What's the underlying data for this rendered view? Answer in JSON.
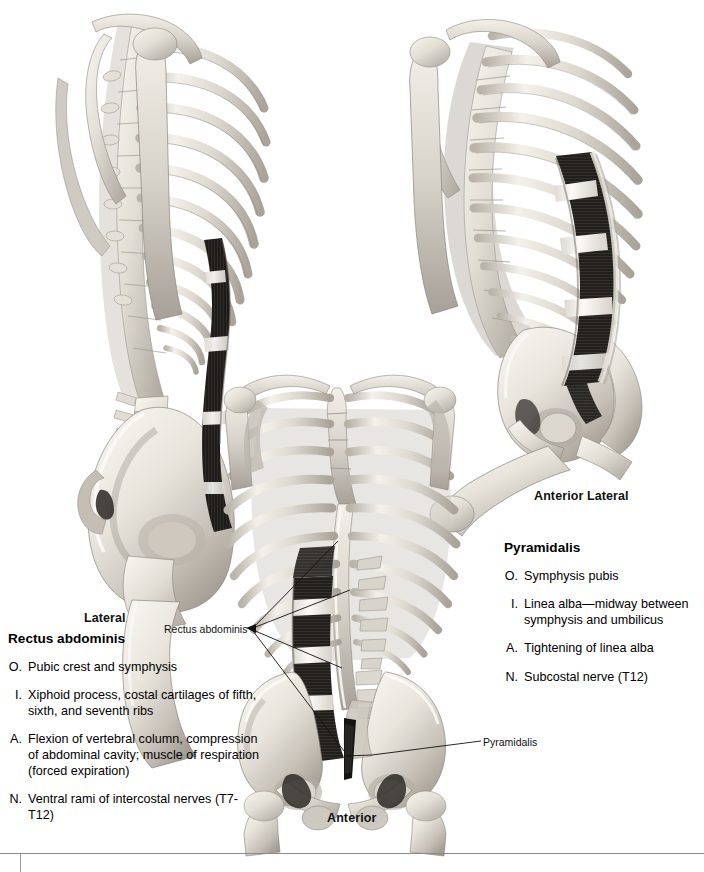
{
  "plate": {
    "subject": "Rectus abdominis and Pyramidalis muscles",
    "views": [
      {
        "id": "lateral",
        "caption": "Lateral"
      },
      {
        "id": "anterior",
        "caption": "Anterior"
      },
      {
        "id": "anterior-lateral",
        "caption": "Anterior Lateral"
      }
    ]
  },
  "captions": {
    "lateral": "Lateral",
    "anterior_lateral": "Anterior Lateral",
    "anterior": "Anterior"
  },
  "leader_labels": {
    "rectus_abdominis": "Rectus abdominis",
    "pyramidalis": "Pyramidalis"
  },
  "muscles": [
    {
      "name": "Rectus abdominis",
      "attributes": [
        {
          "key": "O.",
          "label": "Origin",
          "value": "Pubic crest and symphysis"
        },
        {
          "key": "I.",
          "label": "Insertion",
          "value": "Xiphoid process, costal cartilages of fifth, sixth, and seventh ribs"
        },
        {
          "key": "A.",
          "label": "Action",
          "value": "Flexion of vertebral column, compression of abdominal cavity; muscle of respiration (forced expiration)"
        },
        {
          "key": "N.",
          "label": "Nerve",
          "value": "Ventral rami of intercostal nerves (T7-T12)"
        }
      ]
    },
    {
      "name": "Pyramidalis",
      "attributes": [
        {
          "key": "O.",
          "label": "Origin",
          "value": "Symphysis pubis"
        },
        {
          "key": "I.",
          "label": "Insertion",
          "value": "Linea alba—midway between symphysis and umbilicus"
        },
        {
          "key": "A.",
          "label": "Action",
          "value": "Tightening of linea alba"
        },
        {
          "key": "N.",
          "label": "Nerve",
          "value": "Subcostal nerve (T12)"
        }
      ]
    }
  ],
  "colors": {
    "background": "#ffffff",
    "bone_light": "#f2efe9",
    "bone_mid": "#d2cdc4",
    "bone_shadow": "#a8a29a",
    "muscle_dark": "#1d1b19",
    "muscle_tendon": "#f4f2ee",
    "text": "#000000",
    "leader_line": "#1a1a1a",
    "footer_rule": "#8a8a8a"
  },
  "graphic": {
    "medium": "grayscale photographic anatomical model",
    "structures": [
      "ribs",
      "sternum",
      "clavicle",
      "scapula",
      "humerus",
      "thoracic vertebrae",
      "lumbar vertebrae",
      "sacrum",
      "ilium",
      "pubic symphysis",
      "femur",
      "rectus abdominis",
      "pyramidalis"
    ]
  }
}
